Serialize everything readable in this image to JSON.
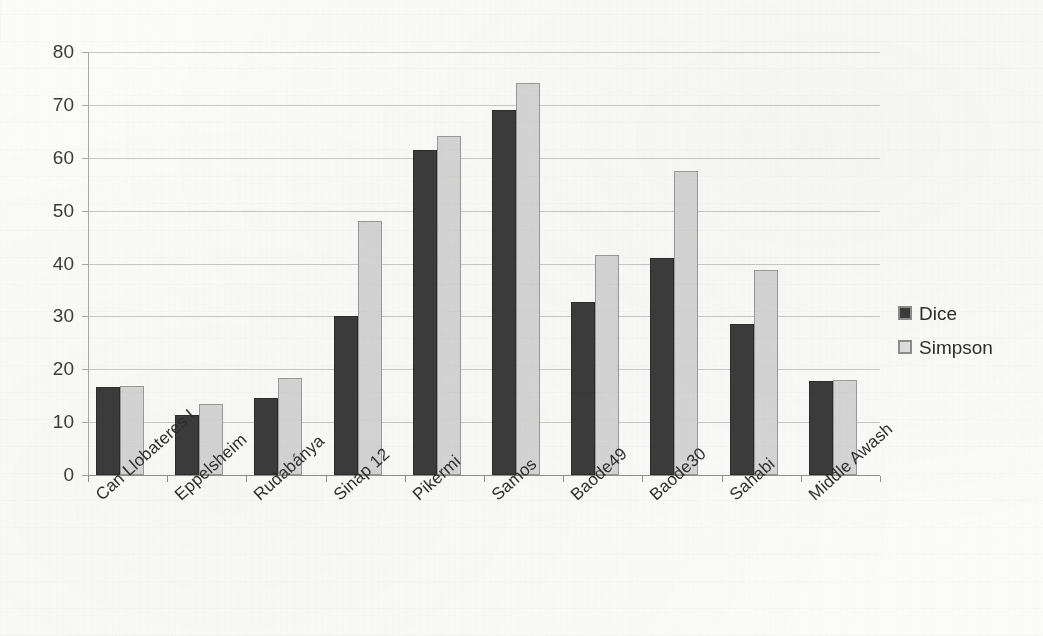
{
  "chart_data": {
    "type": "bar",
    "title": "",
    "xlabel": "",
    "ylabel": "",
    "ylim": [
      0,
      80
    ],
    "ytick_step": 10,
    "yticks": [
      80,
      70,
      60,
      50,
      40,
      30,
      20,
      10,
      0
    ],
    "grid": true,
    "legend_position": "right",
    "categories": [
      "Can Llobateres I",
      "Eppelsheim",
      "Rudabánya",
      "Sinap 12",
      "Pikermi",
      "Samos",
      "Baode49",
      "Baode30",
      "Sahabi",
      "Middle Awash"
    ],
    "series": [
      {
        "name": "Dice",
        "color": "#3c3c3c",
        "values": [
          16.6,
          11.3,
          14.6,
          30.0,
          61.5,
          69.0,
          32.8,
          41.0,
          28.5,
          17.7
        ]
      },
      {
        "name": "Simpson",
        "color": "#d6d6d6",
        "values": [
          16.8,
          13.5,
          18.3,
          48.0,
          64.2,
          74.2,
          41.7,
          57.5,
          38.7,
          17.9
        ]
      }
    ]
  },
  "legend": {
    "items": [
      {
        "label": "Dice",
        "swatch": "dice-swatch"
      },
      {
        "label": "Simpson",
        "swatch": "simpson-swatch"
      }
    ]
  },
  "colors": {
    "dice": "#3c3c3c",
    "simpson": "#d6d6d6",
    "gridline": "#c9c9c9",
    "axis": "#8f8f8f",
    "text": "#2e2e2e",
    "background": "#fbfbf9"
  }
}
